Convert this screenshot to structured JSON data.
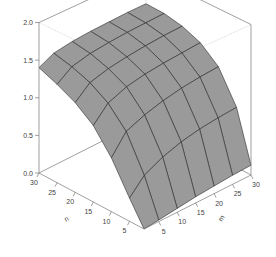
{
  "chart_data": {
    "type": "surface3d",
    "title": "",
    "xlabel": "n",
    "ylabel": "m",
    "zlabel": "",
    "x_ticks": [
      "5",
      "10",
      "15",
      "20",
      "25",
      "30"
    ],
    "y_ticks": [
      "5",
      "10",
      "15",
      "20",
      "25",
      "30"
    ],
    "z_ticks": [
      "0.0",
      "0.5",
      "1.0",
      "1.5",
      "2.0"
    ],
    "xlim": [
      1,
      30
    ],
    "ylim": [
      1,
      30
    ],
    "zlim": [
      0,
      2
    ],
    "grid_n": [
      1,
      5,
      10,
      15,
      20,
      25,
      30
    ],
    "grid_m": [
      1,
      5,
      10,
      15,
      20,
      25,
      30
    ],
    "z_values": [
      [
        0.0,
        0.02,
        0.05,
        0.08,
        0.1,
        0.12,
        0.13
      ],
      [
        0.3,
        0.5,
        0.62,
        0.7,
        0.75,
        0.78,
        0.8
      ],
      [
        0.7,
        0.95,
        1.05,
        1.12,
        1.17,
        1.2,
        1.22
      ],
      [
        1.0,
        1.2,
        1.3,
        1.35,
        1.38,
        1.4,
        1.42
      ],
      [
        1.18,
        1.35,
        1.42,
        1.46,
        1.49,
        1.51,
        1.52
      ],
      [
        1.3,
        1.44,
        1.5,
        1.53,
        1.55,
        1.56,
        1.57
      ],
      [
        1.4,
        1.5,
        1.54,
        1.56,
        1.57,
        1.58,
        1.58
      ]
    ],
    "surface_color": "#9a9a9a",
    "edge_color": "#2a2a2a",
    "box_color": "#777777"
  }
}
